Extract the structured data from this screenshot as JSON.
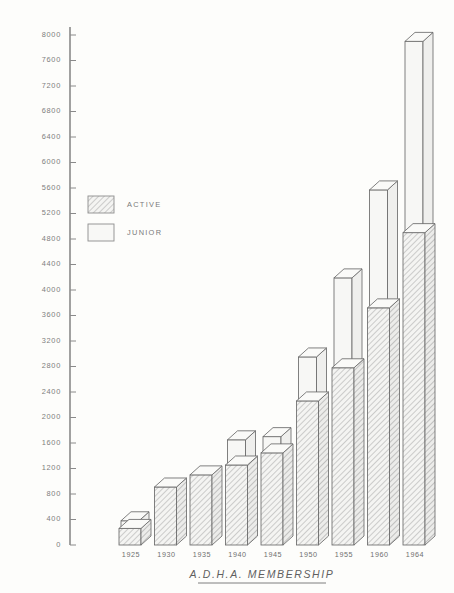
{
  "chart_data": {
    "type": "bar",
    "title": "A.D.H.A. MEMBERSHIP",
    "xlabel": "",
    "ylabel": "",
    "ylim": [
      0,
      8000
    ],
    "ytick_step": 400,
    "yticks": [
      0,
      400,
      800,
      1200,
      1600,
      2000,
      2400,
      2800,
      3200,
      3600,
      4000,
      4400,
      4800,
      5200,
      5600,
      6000,
      6400,
      6800,
      7200,
      7600,
      8000
    ],
    "ytick_labels": [
      "0",
      "400",
      "800",
      "1200",
      "1600",
      "2000",
      "2400",
      "2800",
      "3200",
      "3600",
      "4000",
      "4400",
      "4800",
      "5200",
      "5600",
      "6000",
      "6400",
      "6800",
      "7200",
      "7600",
      "8000"
    ],
    "categories": [
      "1925",
      "1930",
      "1935",
      "1940",
      "1945",
      "1950",
      "1955",
      "1960",
      "1964"
    ],
    "stacked": true,
    "grid": false,
    "legend_position": "upper-left-inside",
    "series": [
      {
        "name": "ACTIVE",
        "pattern": "hatched",
        "values": [
          260,
          910,
          1100,
          1255,
          1445,
          2260,
          2780,
          3720,
          4900
        ]
      },
      {
        "name": "JUNIOR",
        "pattern": "plain",
        "values": [
          120,
          0,
          0,
          395,
          255,
          690,
          1410,
          1850,
          3000
        ]
      }
    ],
    "totals": [
      380,
      910,
      1100,
      1650,
      1700,
      2950,
      4190,
      5570,
      7900
    ],
    "colors": {
      "ink": "#6a6a6a",
      "axis": "#8a8a8a",
      "hatch": "#9a9a9a",
      "face_active": "#f2f2f0",
      "face_junior": "#f7f7f5",
      "paper": "#fdfdfb"
    }
  },
  "legend": {
    "items": [
      {
        "label": "ACTIVE",
        "pattern": "hatched"
      },
      {
        "label": "JUNIOR",
        "pattern": "plain"
      }
    ]
  },
  "title": {
    "text": "A.D.H.A. MEMBERSHIP",
    "underlined": true
  }
}
